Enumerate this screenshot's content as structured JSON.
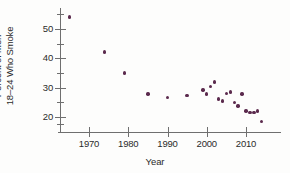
{
  "chart_data": {
    "type": "scatter",
    "title": "",
    "xlabel": "Year",
    "ylabel": "Percent of Men 18–24 Who Smoke",
    "ylabel_lines": [
      "Percent of Men",
      "18–24 Who Smoke"
    ],
    "xlim": [
      1964,
      2016
    ],
    "ylim": [
      17,
      56
    ],
    "xticks": [
      1970,
      1980,
      1990,
      2000,
      2010
    ],
    "xtick_labels": [
      "1970",
      "1980",
      "1990",
      "2000",
      "2010"
    ],
    "yticks": [
      20,
      30,
      40,
      50
    ],
    "ytick_labels": [
      "20",
      "30",
      "40",
      "50"
    ],
    "yminorticks": [
      17.5,
      25,
      35,
      45,
      55
    ],
    "grid": false,
    "legend": null,
    "marker_color": "#5b2a4d",
    "axis_color": "#6f6f6f",
    "points": [
      {
        "x": 1965,
        "y": 54.1
      },
      {
        "x": 1974,
        "y": 42.1
      },
      {
        "x": 1979,
        "y": 35.0
      },
      {
        "x": 1985,
        "y": 27.9
      },
      {
        "x": 1990,
        "y": 26.6
      },
      {
        "x": 1995,
        "y": 27.3
      },
      {
        "x": 1999,
        "y": 29.2
      },
      {
        "x": 2000,
        "y": 27.8
      },
      {
        "x": 2001,
        "y": 30.4
      },
      {
        "x": 2002,
        "y": 32.0
      },
      {
        "x": 2003,
        "y": 26.1
      },
      {
        "x": 2004,
        "y": 25.4
      },
      {
        "x": 2005,
        "y": 28.0
      },
      {
        "x": 2006,
        "y": 28.5
      },
      {
        "x": 2007,
        "y": 25.0
      },
      {
        "x": 2008,
        "y": 23.7
      },
      {
        "x": 2009,
        "y": 27.9
      },
      {
        "x": 2010,
        "y": 22.1
      },
      {
        "x": 2011,
        "y": 21.6
      },
      {
        "x": 2012,
        "y": 21.5
      },
      {
        "x": 2013,
        "y": 22.0
      },
      {
        "x": 2014,
        "y": 18.5
      }
    ]
  },
  "axes": {
    "x_title": "Year",
    "y_title_line1": "Percent of Men",
    "y_title_line2": "18–24 Who Smoke"
  }
}
